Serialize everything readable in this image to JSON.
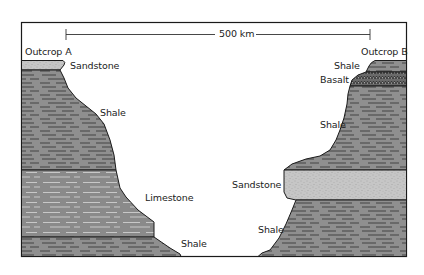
{
  "diagram": {
    "scale_bar": {
      "label": "500 km"
    },
    "outcrops": [
      {
        "name": "Outcrop A",
        "layers_top_to_bottom": [
          "Sandstone",
          "Shale",
          "Limestone",
          "Shale"
        ]
      },
      {
        "name": "Outcrop B",
        "layers_top_to_bottom": [
          "Shale",
          "Basalt",
          "Shale",
          "Sandstone",
          "Shale"
        ]
      }
    ],
    "labels": {
      "outcrop_a": "Outcrop A",
      "outcrop_b": "Outcrop B",
      "a_sandstone": "Sandstone",
      "a_shale_upper": "Shale",
      "a_limestone": "Limestone",
      "a_shale_lower": "Shale",
      "b_shale_top": "Shale",
      "b_basalt": "Basalt",
      "b_shale_middle": "Shale",
      "b_sandstone": "Sandstone",
      "b_shale_lower": "Shale"
    },
    "colors": {
      "shale": "#8f8f8f",
      "limestone": "#8a8a8a",
      "sandstone": "#c4c4c4",
      "basalt": "#6e6e6e",
      "outline": "#1a1a1a"
    }
  }
}
